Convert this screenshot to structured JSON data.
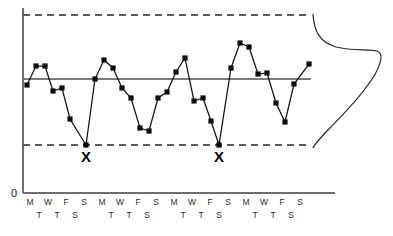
{
  "chart_data": {
    "type": "line",
    "title": "",
    "subtitle": "",
    "xlabel": "",
    "ylabel": "",
    "zero_label": "0",
    "grid": false,
    "legend": "none",
    "axis": {
      "x_start_px": 23,
      "x_end_px": 335,
      "y_top_px": 8,
      "y_zero_px": 193
    },
    "reference_lines": [
      {
        "name": "upper-control-limit",
        "style": "dashed",
        "y_px": 15,
        "x_from_px": 23,
        "x_to_px": 311
      },
      {
        "name": "center-line",
        "style": "solid",
        "y_px": 79,
        "x_from_px": 23,
        "x_to_px": 311
      },
      {
        "name": "lower-control-limit",
        "style": "dashed",
        "y_px": 145,
        "x_from_px": 23,
        "x_to_px": 311
      }
    ],
    "x_tick_labels_row1": [
      "M",
      "W",
      "F",
      "S",
      "M",
      "W",
      "F",
      "S",
      "M",
      "W",
      "F",
      "S",
      "M",
      "W",
      "F",
      "S"
    ],
    "x_tick_labels_row2": [
      "T",
      "T",
      "S",
      "T",
      "T",
      "S",
      "T",
      "T",
      "S",
      "T",
      "T",
      "S"
    ],
    "x_tick_row1_px": [
      30,
      48,
      66,
      84,
      102,
      120,
      138,
      156,
      174,
      192,
      210,
      228,
      246,
      264,
      282,
      300
    ],
    "x_tick_row2_px": [
      39,
      57,
      75,
      111,
      129,
      147,
      183,
      201,
      219,
      255,
      273,
      291
    ],
    "series": [
      {
        "name": "daily-measurement",
        "marker": "square",
        "color": "#0c0c0c",
        "points_px": [
          [
            27,
            85
          ],
          [
            36,
            66
          ],
          [
            45,
            66
          ],
          [
            53,
            91
          ],
          [
            62,
            88
          ],
          [
            70,
            119
          ],
          [
            86,
            145
          ],
          [
            95,
            79
          ],
          [
            104,
            60
          ],
          [
            113,
            68
          ],
          [
            122,
            88
          ],
          [
            131,
            98
          ],
          [
            140,
            128
          ],
          [
            149,
            131
          ],
          [
            158,
            98
          ],
          [
            167,
            92
          ],
          [
            176,
            72
          ],
          [
            185,
            58
          ],
          [
            194,
            101
          ],
          [
            203,
            98
          ],
          [
            211,
            121
          ],
          [
            219,
            145
          ],
          [
            231,
            68
          ],
          [
            240,
            43
          ],
          [
            249,
            47
          ],
          [
            258,
            74
          ],
          [
            267,
            73
          ],
          [
            276,
            103
          ],
          [
            285,
            122
          ],
          [
            294,
            84
          ],
          [
            309,
            64
          ]
        ]
      }
    ],
    "annotations": [
      {
        "name": "out-of-control-marker-1",
        "text": "X",
        "x_px": 86,
        "y_px": 162
      },
      {
        "name": "out-of-control-marker-2",
        "text": "X",
        "x_px": 219,
        "y_px": 162
      }
    ],
    "distribution_curve": {
      "name": "distribution-curve",
      "orientation": "vertical",
      "baseline_x_px": 313,
      "top_y_px": 14,
      "bottom_y_px": 148,
      "peak_x_px": 379,
      "peak_y_px": 53,
      "path": "M 313 14 C 314 32, 320 42, 336 47 C 352 51, 368 49, 377 51 C 384 53, 381 64, 374 76 C 362 96, 340 118, 325 133 C 318 141, 314 145, 313 148"
    }
  }
}
